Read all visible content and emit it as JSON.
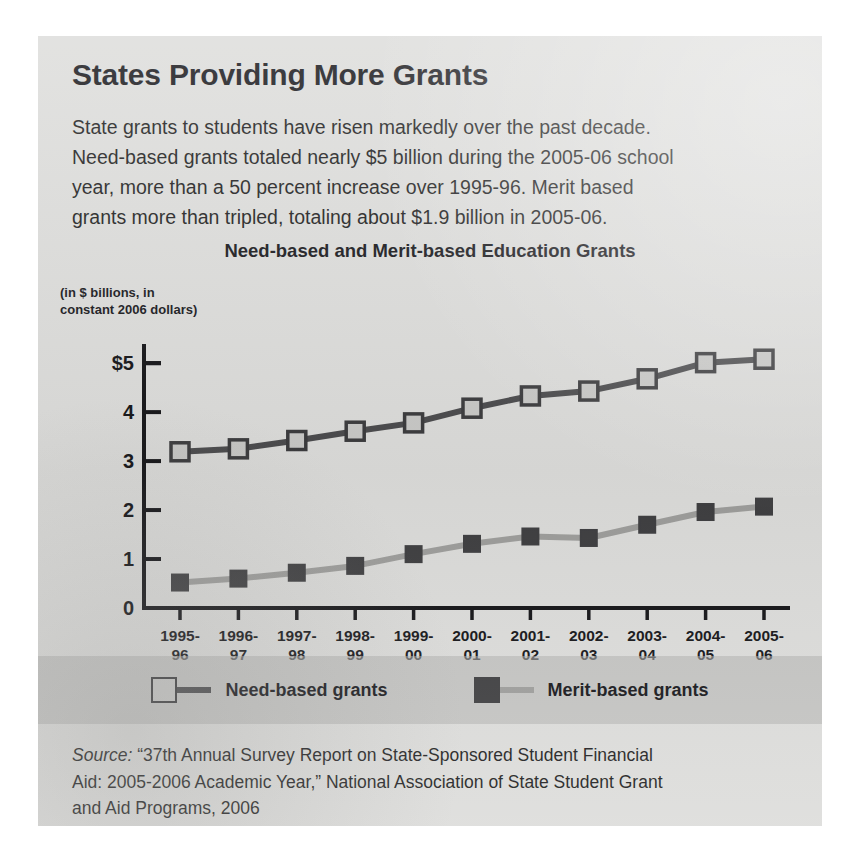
{
  "headline": "States Providing More Grants",
  "lede_lines": [
    "State grants to students have risen markedly over the past decade.",
    "Need-based grants totaled nearly $5 billion during the 2005-06 school",
    "year, more than a 50 percent increase over 1995-96. Merit based",
    "grants more than tripled, totaling about $1.9 billion in 2005-06."
  ],
  "source": {
    "label": "Source:",
    "lines": [
      "“37th Annual Survey Report on State-Sponsored Student Financial",
      "Aid: 2005-2006 Academic Year,” National Association of State Student Grant",
      "and Aid Programs, 2006"
    ]
  },
  "colors": {
    "panel_background": "#dcdcda",
    "need_line": "#4a4a4c",
    "need_marker_fill": "#c8c8c6",
    "need_marker_stroke": "#3a3a3c",
    "merit_line": "#9d9d9b",
    "merit_marker_fill": "#3e3e40",
    "axis": "#131316",
    "text": "#16161a"
  },
  "chart_data": {
    "type": "line",
    "title": "Need-based and Merit-based Education Grants",
    "axis_unit_label": "(in $ billions, in\nconstant 2006 dollars)",
    "xlabel": "",
    "ylabel": "",
    "ylim": [
      0,
      5.35
    ],
    "yticks": [
      0,
      1,
      2,
      3,
      4,
      5
    ],
    "ytick_labels": [
      "0",
      "1",
      "2",
      "3",
      "4",
      "$5"
    ],
    "grid": false,
    "legend_position": "bottom",
    "categories": [
      "1995-\n96",
      "1996-\n97",
      "1997-\n98",
      "1998-\n99",
      "1999-\n00",
      "2000-\n01",
      "2001-\n02",
      "2002-\n03",
      "2003-\n04",
      "2004-\n05",
      "2005-\n06"
    ],
    "series": [
      {
        "name": "Need-based grants",
        "marker": "open-square",
        "values": [
          3.19,
          3.25,
          3.42,
          3.61,
          3.78,
          4.08,
          4.33,
          4.43,
          4.68,
          5.01,
          5.08
        ]
      },
      {
        "name": "Merit-based grants",
        "marker": "filled-square",
        "values": [
          0.52,
          0.6,
          0.72,
          0.86,
          1.1,
          1.31,
          1.46,
          1.43,
          1.7,
          1.96,
          2.07
        ]
      }
    ]
  }
}
